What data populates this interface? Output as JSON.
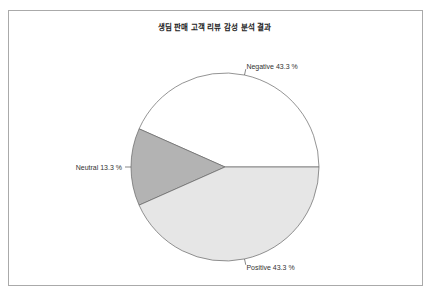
{
  "chart_data": {
    "type": "pie",
    "title": "생딤 판매 고객 리뷰 감성 분석 결과",
    "categories": [
      "Negative",
      "Neutral",
      "Positive"
    ],
    "values": [
      43.3,
      13.3,
      43.3
    ],
    "labels": [
      "Negative 43.3 %",
      "Neutral 13.3 %",
      "Positive 43.3 %"
    ],
    "colors": [
      "#ffffff",
      "#b3b3b3",
      "#e6e6e6"
    ],
    "start_angle_deg": 0,
    "direction": "counterclockwise",
    "legend": "none"
  }
}
